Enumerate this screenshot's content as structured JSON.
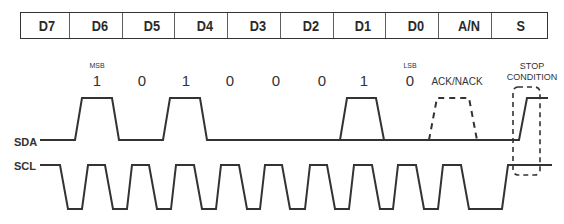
{
  "header": {
    "cells": [
      "D7",
      "D6",
      "D5",
      "D4",
      "D3",
      "D2",
      "D1",
      "D0",
      "A/N",
      "S"
    ]
  },
  "bits": {
    "values": [
      "1",
      "0",
      "1",
      "0",
      "0",
      "0",
      "1",
      "0"
    ],
    "msb_label": "MSB",
    "lsb_label": "LSB",
    "ack_label": "ACK/NACK",
    "stop_label_line1": "STOP",
    "stop_label_line2": "CONDITION"
  },
  "signals": {
    "sda_label": "SDA",
    "scl_label": "SCL"
  },
  "colors": {
    "line": "#333333",
    "text": "#2a2a2a"
  }
}
